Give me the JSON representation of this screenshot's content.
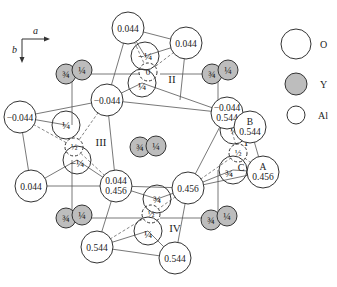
{
  "axes": {
    "a_label": "a",
    "b_label": "b"
  },
  "legend": [
    {
      "symbol": "O",
      "label": "O",
      "fill": "#ffffff"
    },
    {
      "symbol": "Y",
      "label": "Y",
      "fill": "#bdbdbd"
    },
    {
      "symbol": "Al",
      "label": "Al",
      "fill": "#ffffff"
    }
  ],
  "regions": [
    "I",
    "II",
    "III",
    "IV"
  ],
  "oxygen": [
    {
      "x": 128,
      "y": 28,
      "lines": [
        "0.044"
      ]
    },
    {
      "x": 186,
      "y": 43,
      "lines": [
        "0.044"
      ]
    },
    {
      "x": 107,
      "y": 100,
      "lines": [
        "−0.044"
      ]
    },
    {
      "x": 20,
      "y": 117,
      "lines": [
        "−0.044"
      ]
    },
    {
      "x": 227,
      "y": 113,
      "lines": [
        "−0.044",
        "0.544"
      ]
    },
    {
      "x": 250,
      "y": 127,
      "lines": [
        "B",
        "0.544"
      ]
    },
    {
      "x": 116,
      "y": 186,
      "lines": [
        "0.044",
        "0.456"
      ]
    },
    {
      "x": 31,
      "y": 186,
      "lines": [
        "0.044"
      ]
    },
    {
      "x": 188,
      "y": 188,
      "lines": [
        "0.456"
      ]
    },
    {
      "x": 263,
      "y": 172,
      "lines": [
        "A",
        "0.456"
      ]
    },
    {
      "x": 97,
      "y": 247,
      "lines": [
        "0.544"
      ]
    },
    {
      "x": 175,
      "y": 258,
      "lines": [
        "0.544"
      ]
    }
  ],
  "aluminum": [
    {
      "x": 145,
      "y": 56,
      "label": "−¼"
    },
    {
      "x": 142,
      "y": 83,
      "label": "¼"
    },
    {
      "x": 66,
      "y": 125,
      "label": "¼"
    },
    {
      "x": 77,
      "y": 160,
      "label": "−¼"
    },
    {
      "x": 234,
      "y": 130,
      "label": "¼"
    },
    {
      "x": 233,
      "y": 170,
      "label": "¾",
      "tag": "C"
    },
    {
      "x": 157,
      "y": 199,
      "label": "¾"
    },
    {
      "x": 148,
      "y": 231,
      "label": "¼"
    }
  ],
  "aluminum_hidden": [
    {
      "x": 148,
      "y": 72,
      "label": "0"
    },
    {
      "x": 74,
      "y": 147,
      "label": "½"
    },
    {
      "x": 238,
      "y": 153,
      "label": "½"
    },
    {
      "x": 151,
      "y": 214,
      "label": "½"
    }
  ],
  "yttrium": [
    {
      "x": 66,
      "y": 74,
      "label": "¾"
    },
    {
      "x": 82,
      "y": 70,
      "label": "¼"
    },
    {
      "x": 212,
      "y": 74,
      "label": "¾"
    },
    {
      "x": 228,
      "y": 70,
      "label": "¼"
    },
    {
      "x": 140,
      "y": 147,
      "label": "¾"
    },
    {
      "x": 156,
      "y": 146,
      "label": "¼"
    },
    {
      "x": 211,
      "y": 220,
      "label": "¾"
    },
    {
      "x": 227,
      "y": 216,
      "label": "¼"
    },
    {
      "x": 66,
      "y": 218,
      "label": "¾"
    },
    {
      "x": 82,
      "y": 215,
      "label": "¼"
    }
  ],
  "region_labels": [
    {
      "label": "II",
      "x": 172,
      "y": 80
    },
    {
      "label": "III",
      "x": 100,
      "y": 143
    },
    {
      "label": "I",
      "x": 246,
      "y": 143
    },
    {
      "label": "IV",
      "x": 175,
      "y": 229
    }
  ]
}
